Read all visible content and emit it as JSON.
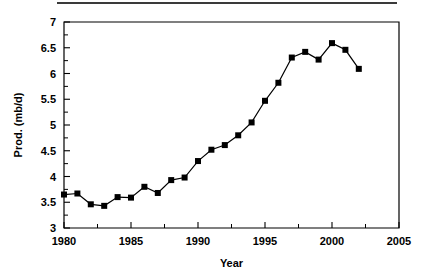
{
  "figure": {
    "top_rule_name": "horizontal-rule"
  },
  "chart_data": {
    "type": "line",
    "title": "",
    "xlabel": "Year",
    "ylabel": "Prod. (mb/d)",
    "x": [
      1980,
      1981,
      1982,
      1983,
      1984,
      1985,
      1986,
      1987,
      1988,
      1989,
      1990,
      1991,
      1992,
      1993,
      1994,
      1995,
      1996,
      1997,
      1998,
      1999,
      2000,
      2001,
      2002
    ],
    "values": [
      3.65,
      3.67,
      3.46,
      3.43,
      3.6,
      3.59,
      3.8,
      3.68,
      3.93,
      3.98,
      4.3,
      4.52,
      4.61,
      4.8,
      5.05,
      5.47,
      5.82,
      6.31,
      6.42,
      6.27,
      6.59,
      6.46,
      6.09
    ],
    "series": [
      {
        "name": "Prod. (mb/d)",
        "values": [
          3.65,
          3.67,
          3.46,
          3.43,
          3.6,
          3.59,
          3.8,
          3.68,
          3.93,
          3.98,
          4.3,
          4.52,
          4.61,
          4.8,
          5.05,
          5.47,
          5.82,
          6.31,
          6.42,
          6.27,
          6.59,
          6.46,
          6.09
        ]
      }
    ],
    "xlim": [
      1980,
      2005
    ],
    "ylim": [
      3,
      7
    ],
    "xticks": [
      1980,
      1985,
      1990,
      1995,
      2000,
      2005
    ],
    "xtick_labels": [
      "1980",
      "1985",
      "1990",
      "1995",
      "2000",
      "2005"
    ],
    "x_minor_tick_interval": 2.5,
    "yticks": [
      3,
      3.5,
      4,
      4.5,
      5,
      5.5,
      6,
      6.5,
      7
    ],
    "ytick_labels": [
      "3",
      "3.5",
      "4",
      "4.5",
      "5",
      "5.5",
      "6",
      "6.5",
      "7"
    ],
    "y_minor_tick_interval": 0.25,
    "grid": false,
    "legend": false,
    "legend_position": "none",
    "marker": "square",
    "line_color": "#000000",
    "marker_color": "#000000",
    "annotations": []
  }
}
